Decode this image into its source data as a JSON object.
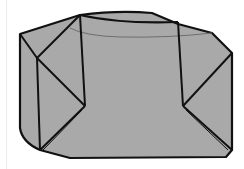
{
  "figure": {
    "fill_color": "#a9a9a9",
    "stroke_color": "#111111",
    "hidden_edge_color": "#6e6e6e",
    "background": "#ffffff"
  }
}
